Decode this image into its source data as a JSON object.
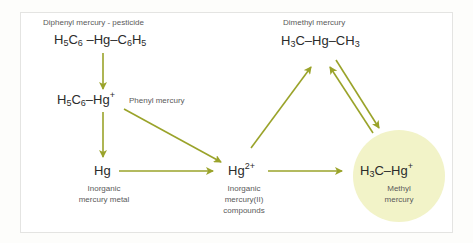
{
  "diagram": {
    "colors": {
      "arrow": "#9aa32a",
      "circle_fill": "#f2f3c8",
      "frame_border": "#e4e4e2",
      "text": "#2b2b2b",
      "label": "#5a5a5a"
    },
    "nodes": {
      "diphenyl": {
        "label": "Diphenyl mercury  - pesticide",
        "formula": {
          "a": "H",
          "a_sub": "5",
          "b": "C",
          "b_sub": "6",
          "c": " –Hg–C",
          "c_sub": "6",
          "d": "H",
          "d_sub": "5"
        }
      },
      "phenyl": {
        "label": "Phenyl mercury",
        "formula": {
          "a": "H",
          "a_sub": "5",
          "b": "C",
          "b_sub": "6",
          "c": "–Hg",
          "c_sup": "+"
        }
      },
      "hg_metal": {
        "formula": "Hg",
        "label_line1": "Inorganic",
        "label_line2": "mercury metal"
      },
      "hg2": {
        "formula": "Hg",
        "formula_sup": "2+",
        "label_line1": "Inorganic",
        "label_line2": "mercury(II)",
        "label_line3": "compounds"
      },
      "dimethyl": {
        "label": "Dimethyl mercury",
        "formula": {
          "a": "H",
          "a_sub": "3",
          "b": "C–Hg–CH",
          "b_sub": "3"
        }
      },
      "methyl": {
        "formula": {
          "a": "H",
          "a_sub": "3",
          "b": "C–Hg",
          "b_sup": "+"
        },
        "label_line1": "Methyl",
        "label_line2": "mercury"
      }
    },
    "edges": [
      {
        "from": "diphenyl",
        "to": "phenyl"
      },
      {
        "from": "phenyl",
        "to": "hg_metal"
      },
      {
        "from": "phenyl",
        "to": "hg2"
      },
      {
        "from": "hg_metal",
        "to": "hg2"
      },
      {
        "from": "hg2",
        "to": "dimethyl"
      },
      {
        "from": "hg2",
        "to": "methyl"
      },
      {
        "from": "methyl",
        "to": "dimethyl"
      },
      {
        "from": "dimethyl",
        "to": "methyl"
      }
    ]
  }
}
